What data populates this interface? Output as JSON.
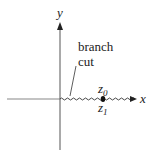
{
  "diagram": {
    "axes": {
      "x_label": "x",
      "y_label": "y"
    },
    "branch_cut": {
      "label_line1": "branch",
      "label_line2": "cut"
    },
    "points": {
      "upper": {
        "base": "z",
        "sub": "0"
      },
      "lower": {
        "base": "z",
        "sub": "1"
      }
    },
    "colors": {
      "axis": "#555555",
      "text": "#222222"
    }
  }
}
